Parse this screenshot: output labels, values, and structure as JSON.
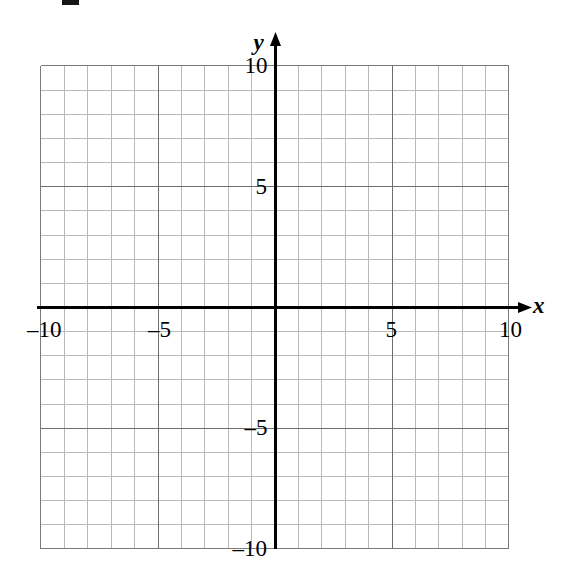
{
  "figure": {
    "type": "coordinate-grid",
    "background_color": "#ffffff",
    "width": 565,
    "height": 580
  },
  "chart_data": {
    "type": "scatter",
    "title": "",
    "subtitle": "",
    "xlabel": "x",
    "ylabel": "y",
    "xlim": [
      -10,
      10
    ],
    "ylim": [
      -10,
      10
    ],
    "grid": true,
    "grid_minor_step": 1,
    "grid_major_step": 5,
    "legend": "none",
    "series": [],
    "x_tick_labels": [
      "–10",
      "–5",
      "5",
      "10"
    ],
    "x_tick_values": [
      -10,
      -5,
      5,
      10
    ],
    "y_tick_labels": [
      "10",
      "5",
      "–5",
      "–10"
    ],
    "y_tick_values": [
      10,
      5,
      -5,
      -10
    ],
    "annotations": []
  },
  "axes": {
    "x_axis_name": "x",
    "y_axis_name": "y",
    "x_axis_arrow": "arrow-right",
    "y_axis_arrow": "arrow-up",
    "axis_color": "#000000",
    "grid_minor_color": "#b8b8b8",
    "grid_major_color": "#6e6e6e",
    "border_color": "#7a7a7a"
  },
  "x_ticks": [
    {
      "label": "–10",
      "value": -10
    },
    {
      "label": "–5",
      "value": -5
    },
    {
      "label": "5",
      "value": 5
    },
    {
      "label": "10",
      "value": 10
    }
  ],
  "y_ticks": [
    {
      "label": "10",
      "value": 10
    },
    {
      "label": "5",
      "value": 5
    },
    {
      "label": "–5",
      "value": -5
    },
    {
      "label": "–10",
      "value": -10
    }
  ],
  "artifact": {
    "present": true,
    "name": "scan-artifact-mark"
  }
}
